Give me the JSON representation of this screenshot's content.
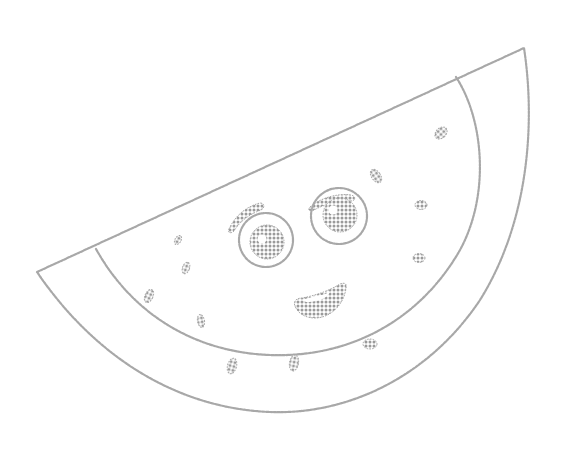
{
  "image": {
    "subject": "watermelon-slice-coloring-page",
    "style": "dotted outline line art",
    "colors": {
      "background": "#ffffff",
      "line": "#a8a8a8",
      "dot_fill": "#9a9a9a"
    }
  },
  "elements": {
    "rind_outer": "watermelon-rind-outer-edge",
    "rind_inner": "watermelon-rind-inner-edge",
    "face": {
      "eyes": 2,
      "eyebrows": 2,
      "mouth": "open-smile"
    },
    "seed_count": 11
  }
}
